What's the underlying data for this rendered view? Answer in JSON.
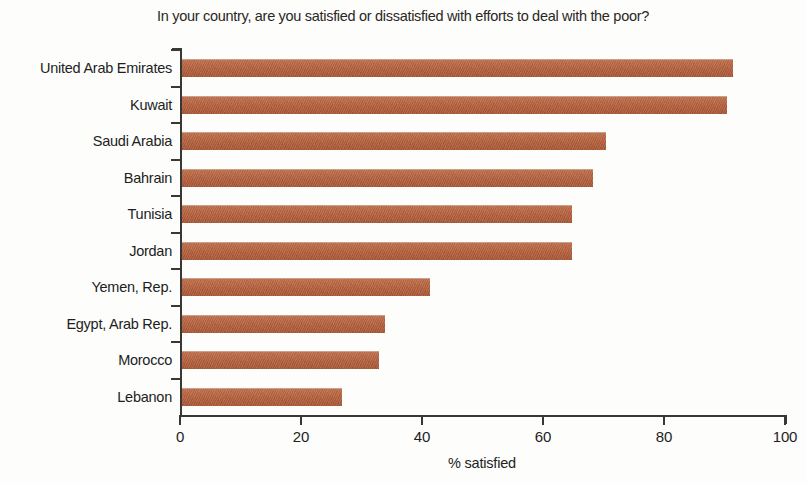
{
  "chart_data": {
    "type": "bar",
    "orientation": "horizontal",
    "title": "In your country, are you satisfied or dissatisfied with efforts to deal with the poor?",
    "xlabel": "% satisfied",
    "ylabel": "",
    "xlim": [
      0,
      100
    ],
    "xticks": [
      0,
      20,
      40,
      60,
      80,
      100
    ],
    "xtick_labels": [
      "0",
      "20",
      "40",
      "60",
      "80",
      "100"
    ],
    "grid": false,
    "legend": null,
    "bar_color": "#b35f3c",
    "categories": [
      "United Arab Emirates",
      "Kuwait",
      "Saudi Arabia",
      "Bahrain",
      "Tunisia",
      "Jordan",
      "Yemen, Rep.",
      "Egypt, Arab Rep.",
      "Morocco",
      "Lebanon"
    ],
    "values": [
      91,
      90,
      70,
      68,
      64.5,
      64.5,
      41,
      33.5,
      32.5,
      26.5
    ]
  }
}
